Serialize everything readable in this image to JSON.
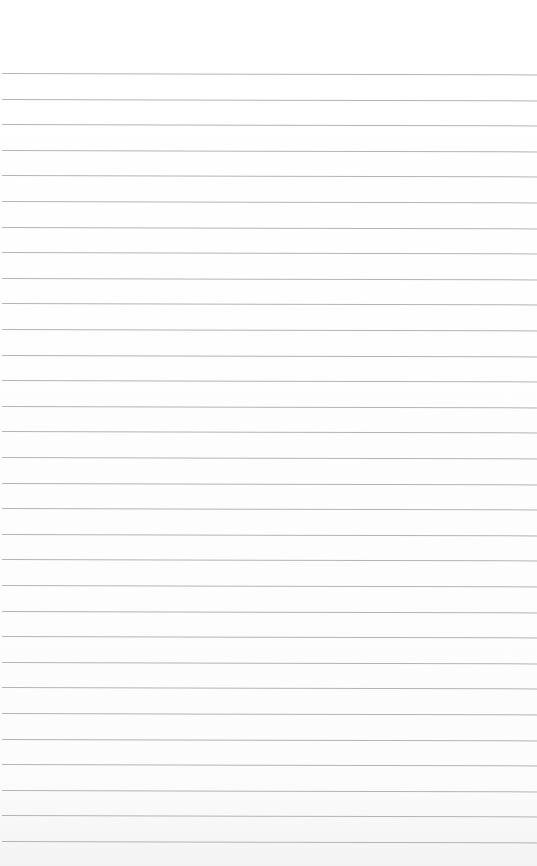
{
  "page": {
    "type": "lined-paper",
    "background_color": "#fdfdfd",
    "rule_color": "#b4b4b4",
    "rule_count": 31,
    "first_rule_y": 73,
    "rule_spacing": 25.6
  }
}
